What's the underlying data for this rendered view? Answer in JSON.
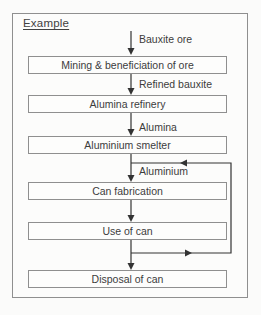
{
  "diagram": {
    "title": "Example",
    "boxes": [
      {
        "label": "Mining & beneficiation of ore"
      },
      {
        "label": "Alumina refinery"
      },
      {
        "label": "Aluminium smelter"
      },
      {
        "label": "Can fabrication"
      },
      {
        "label": "Use of can"
      },
      {
        "label": "Disposal of can"
      }
    ],
    "flow_labels": [
      {
        "label": "Bauxite ore"
      },
      {
        "label": "Refined bauxite"
      },
      {
        "label": "Alumina"
      },
      {
        "label": "Aluminium"
      }
    ],
    "colors": {
      "frame_border": "#8f8f8f",
      "box_border": "#8f8f8f",
      "arrow": "#333333",
      "text": "#3c3c3c",
      "background": "#fbfbfa"
    }
  }
}
